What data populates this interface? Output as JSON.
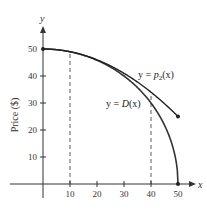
{
  "chart_data": {
    "type": "line",
    "title": "",
    "xlabel": "x",
    "ylabel": "Price ($)",
    "y_axis_var": "y",
    "x_axis_var": "x",
    "xlim": [
      0,
      50
    ],
    "ylim": [
      0,
      50
    ],
    "x_ticks": [
      10,
      20,
      30,
      40,
      50
    ],
    "y_ticks": [
      10,
      20,
      30,
      40,
      50
    ],
    "grid": false,
    "legend": "none (inline curve labels)",
    "series": [
      {
        "name": "y = D(x)",
        "label_parts": {
          "prefix": "y = ",
          "func": "D",
          "arg": "(x)"
        },
        "formula": "sqrt(2500 - x^2)",
        "x": [
          0,
          5,
          10,
          15,
          20,
          25,
          30,
          35,
          40,
          45,
          48,
          50
        ],
        "values": [
          50,
          49.75,
          48.99,
          47.7,
          45.83,
          43.3,
          40,
          35.71,
          30,
          21.79,
          14,
          0
        ],
        "endpoints": [
          [
            0,
            50
          ],
          [
            50,
            0
          ]
        ]
      },
      {
        "name": "y = p2(x)",
        "label_parts": {
          "prefix": "y = ",
          "func": "p",
          "sub": "2",
          "arg": "(x)"
        },
        "formula": "50 - x^2/100",
        "x": [
          0,
          5,
          10,
          15,
          20,
          25,
          30,
          35,
          40,
          45,
          50
        ],
        "values": [
          50,
          49.75,
          49,
          47.75,
          46,
          43.75,
          41,
          37.75,
          34,
          29.75,
          25
        ],
        "endpoints": [
          [
            0,
            50
          ],
          [
            50,
            25
          ]
        ]
      }
    ],
    "annotations": [
      {
        "type": "dashed-vertical",
        "x": 10,
        "from": 0,
        "to": 49
      },
      {
        "type": "dashed-vertical",
        "x": 40,
        "from": 0,
        "to": 34
      }
    ]
  },
  "labels": {
    "y_axis_var": "y",
    "x_axis_var": "x",
    "ylabel": "Price ($)",
    "x_ticks": [
      "10",
      "20",
      "30",
      "40",
      "50"
    ],
    "y_ticks": [
      "10",
      "20",
      "30",
      "40",
      "50"
    ],
    "p2_prefix": "y = ",
    "p2_func": "p",
    "p2_sub": "2",
    "p2_arg": "(x)",
    "d_prefix": "y = ",
    "d_func": "D",
    "d_arg": "(x)"
  }
}
